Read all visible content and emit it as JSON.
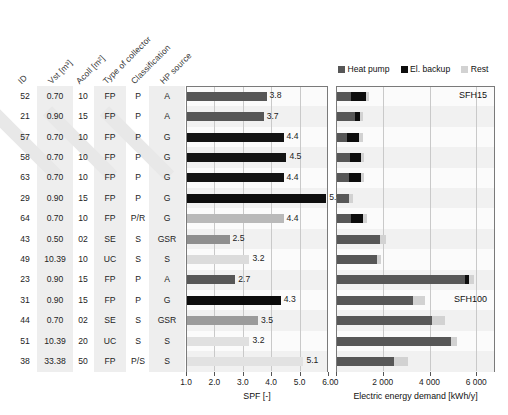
{
  "figure": {
    "table_headers": [
      {
        "key": "id",
        "label": "ID",
        "banded": false
      },
      {
        "key": "vst",
        "label": "Vst [m³]",
        "banded": true
      },
      {
        "key": "acoll",
        "label": "Acoll [m²]",
        "banded": false
      },
      {
        "key": "collector",
        "label": "Type of collector",
        "banded": true
      },
      {
        "key": "classification",
        "label": "Classification",
        "banded": false
      },
      {
        "key": "hp",
        "label": "HP source",
        "banded": true
      }
    ],
    "rows": [
      {
        "id": "52",
        "vst": "0.70",
        "acoll": "10",
        "collector": "FP",
        "classification": "P",
        "hp": "A"
      },
      {
        "id": "21",
        "vst": "0.90",
        "acoll": "15",
        "collector": "FP",
        "classification": "P",
        "hp": "A"
      },
      {
        "id": "57",
        "vst": "0.70",
        "acoll": "10",
        "collector": "FP",
        "classification": "P",
        "hp": "G"
      },
      {
        "id": "58",
        "vst": "0.70",
        "acoll": "10",
        "collector": "FP",
        "classification": "P",
        "hp": "G"
      },
      {
        "id": "63",
        "vst": "0.70",
        "acoll": "10",
        "collector": "FP",
        "classification": "P",
        "hp": "G"
      },
      {
        "id": "29",
        "vst": "0.90",
        "acoll": "15",
        "collector": "FP",
        "classification": "P",
        "hp": "G"
      },
      {
        "id": "64",
        "vst": "0.70",
        "acoll": "10",
        "collector": "FP",
        "classification": "P/R",
        "hp": "G"
      },
      {
        "id": "43",
        "vst": "0.50",
        "acoll": "02",
        "collector": "SE",
        "classification": "S",
        "hp": "GSR"
      },
      {
        "id": "49",
        "vst": "10.39",
        "acoll": "10",
        "collector": "UC",
        "classification": "S",
        "hp": "S"
      },
      {
        "id": "23",
        "vst": "0.90",
        "acoll": "15",
        "collector": "FP",
        "classification": "P",
        "hp": "A"
      },
      {
        "id": "31",
        "vst": "0.90",
        "acoll": "15",
        "collector": "FP",
        "classification": "P",
        "hp": "G"
      },
      {
        "id": "44",
        "vst": "0.70",
        "acoll": "02",
        "collector": "SE",
        "classification": "S",
        "hp": "GSR"
      },
      {
        "id": "51",
        "vst": "10.39",
        "acoll": "20",
        "collector": "UC",
        "classification": "S",
        "hp": "S"
      },
      {
        "id": "38",
        "vst": "33.38",
        "acoll": "50",
        "collector": "FP",
        "classification": "P/S",
        "hp": "S"
      }
    ],
    "legend": {
      "items": [
        {
          "label": "Heat pump",
          "color": "#575757"
        },
        {
          "label": "El. backup",
          "color": "#0d0d0d"
        },
        {
          "label": "Rest",
          "color": "#d2d2d2"
        }
      ]
    },
    "annotations": [
      {
        "text": "SFH15"
      },
      {
        "text": "SFH100"
      }
    ]
  },
  "chart_data": [
    {
      "type": "bar",
      "orientation": "horizontal",
      "title": "",
      "xlabel": "SPF [-]",
      "ylabel": "",
      "xlim": [
        1.0,
        6.0
      ],
      "xticks": [
        1.0,
        2.0,
        3.0,
        4.0,
        5.0,
        6.0
      ],
      "xticklabels": [
        "1.0",
        "2.0",
        "3.0",
        "4.0",
        "5.0",
        "6.0"
      ],
      "grid": true,
      "categories": [
        "52",
        "21",
        "57",
        "58",
        "63",
        "29",
        "64",
        "43",
        "49",
        "23",
        "31",
        "44",
        "51",
        "38"
      ],
      "values": [
        3.8,
        3.7,
        4.4,
        4.5,
        4.4,
        5.9,
        4.4,
        2.5,
        3.2,
        2.7,
        4.3,
        3.5,
        3.2,
        5.1
      ],
      "datalabels": [
        "3.8",
        "3.7",
        "4.4",
        "4.5",
        "4.4",
        "5.9",
        "4.4",
        "2.5",
        "3.2",
        "2.7",
        "4.3",
        "3.5",
        "3.2",
        "5.1"
      ],
      "bar_colors": [
        "#575757",
        "#575757",
        "#141414",
        "#141414",
        "#141414",
        "#0d0d0d",
        "#b9b9b9",
        "#8f8f8f",
        "#dcdcdc",
        "#575757",
        "#0d0d0d",
        "#9b9b9b",
        "#e0e0e0",
        "#e2e2e2"
      ]
    },
    {
      "type": "bar",
      "orientation": "horizontal",
      "stacked": true,
      "title": "",
      "xlabel": "Electric energy demand [kWh/y]",
      "ylabel": "",
      "xlim": [
        0,
        6800
      ],
      "xticks": [
        0,
        2000,
        4000,
        6000
      ],
      "xticklabels": [
        "0",
        "2 000",
        "4 000",
        "6 000"
      ],
      "grid": true,
      "categories": [
        "52",
        "21",
        "57",
        "58",
        "63",
        "29",
        "64",
        "43",
        "49",
        "23",
        "31",
        "44",
        "51",
        "38"
      ],
      "series": [
        {
          "name": "Heat pump",
          "color": "#575757",
          "values": [
            620,
            760,
            440,
            560,
            500,
            520,
            590,
            1830,
            1690,
            5460,
            3230,
            4060,
            4870,
            2450
          ]
        },
        {
          "name": "El. backup",
          "color": "#0d0d0d",
          "values": [
            620,
            210,
            520,
            480,
            520,
            0,
            520,
            0,
            0,
            180,
            0,
            0,
            0,
            0
          ]
        },
        {
          "name": "Rest",
          "color": "#d2d2d2",
          "values": [
            110,
            150,
            140,
            120,
            130,
            180,
            170,
            280,
            200,
            230,
            530,
            540,
            260,
            580
          ]
        }
      ]
    }
  ]
}
